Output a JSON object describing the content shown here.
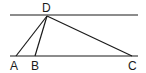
{
  "diagram": {
    "type": "geometry",
    "points": {
      "A": {
        "label": "A",
        "x": 16,
        "y": 56
      },
      "B": {
        "label": "B",
        "x": 35,
        "y": 56
      },
      "C": {
        "label": "C",
        "x": 132,
        "y": 56
      },
      "D": {
        "label": "D",
        "x": 47,
        "y": 15
      }
    },
    "lines": [
      {
        "name": "upper-parallel",
        "x1": 10,
        "y1": 15,
        "x2": 138,
        "y2": 15
      },
      {
        "name": "lower-parallel",
        "x1": 10,
        "y1": 56,
        "x2": 138,
        "y2": 56
      },
      {
        "name": "DA",
        "from": "D",
        "to": "A"
      },
      {
        "name": "DB",
        "from": "D",
        "to": "B"
      },
      {
        "name": "DC",
        "from": "D",
        "to": "C"
      }
    ],
    "colors": {
      "stroke": "#1a1a1a",
      "background": "#ffffff"
    }
  }
}
